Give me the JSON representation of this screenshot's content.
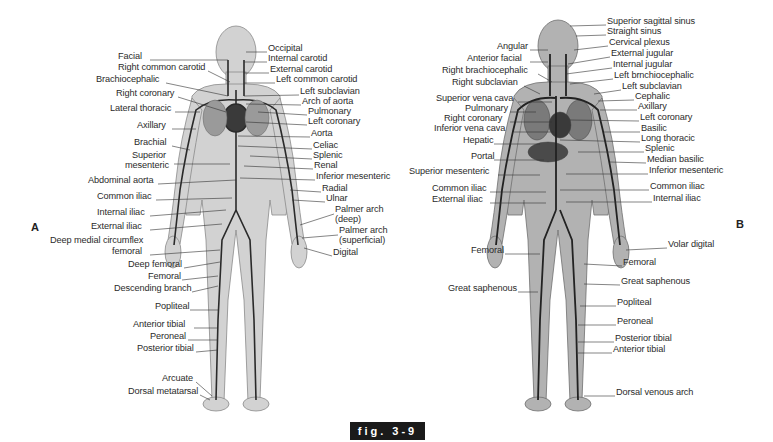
{
  "figure": {
    "caption": "fig. 3-9",
    "panel_a_letter": "A",
    "panel_b_letter": "B"
  },
  "panel_a": {
    "title": "Arterial system",
    "left_labels": [
      {
        "text": "Facial",
        "x": 118,
        "y": 56
      },
      {
        "text": "Right common carotid",
        "x": 118,
        "y": 67
      },
      {
        "text": "Brachiocephalic",
        "x": 96,
        "y": 79
      },
      {
        "text": "Right coronary",
        "x": 116,
        "y": 93
      },
      {
        "text": "Lateral thoracic",
        "x": 110,
        "y": 108
      },
      {
        "text": "Axillary",
        "x": 137,
        "y": 125
      },
      {
        "text": "Brachial",
        "x": 134,
        "y": 142
      },
      {
        "text": "Superior",
        "x": 132,
        "y": 155
      },
      {
        "text": "mesenteric",
        "x": 125,
        "y": 165
      },
      {
        "text": "Abdominal aorta",
        "x": 88,
        "y": 180
      },
      {
        "text": "Common iliac",
        "x": 97,
        "y": 196
      },
      {
        "text": "Internal iliac",
        "x": 97,
        "y": 212
      },
      {
        "text": "External iliac",
        "x": 91,
        "y": 226
      },
      {
        "text": "Deep medial circumflex",
        "x": 50,
        "y": 240
      },
      {
        "text": "femoral",
        "x": 112,
        "y": 251
      },
      {
        "text": "Deep femoral",
        "x": 128,
        "y": 264
      },
      {
        "text": "Femoral",
        "x": 148,
        "y": 276
      },
      {
        "text": "Descending branch",
        "x": 114,
        "y": 288
      },
      {
        "text": "Popliteal",
        "x": 155,
        "y": 306
      },
      {
        "text": "Anterior tibial",
        "x": 133,
        "y": 324
      },
      {
        "text": "Peroneal",
        "x": 150,
        "y": 336
      },
      {
        "text": "Posterior tibial",
        "x": 137,
        "y": 348
      },
      {
        "text": "Arcuate",
        "x": 162,
        "y": 378
      },
      {
        "text": "Dorsal metatarsal",
        "x": 128,
        "y": 391
      }
    ],
    "right_labels": [
      {
        "text": "Occipital",
        "x": 268,
        "y": 48
      },
      {
        "text": "Internal carotid",
        "x": 268,
        "y": 58
      },
      {
        "text": "External carotid",
        "x": 270,
        "y": 69
      },
      {
        "text": "Left common carotid",
        "x": 276,
        "y": 79
      },
      {
        "text": "Left subclavian",
        "x": 300,
        "y": 91
      },
      {
        "text": "Arch of aorta",
        "x": 302,
        "y": 101
      },
      {
        "text": "Pulmonary",
        "x": 308,
        "y": 111
      },
      {
        "text": "Left coronary",
        "x": 308,
        "y": 121
      },
      {
        "text": "Aorta",
        "x": 311,
        "y": 133
      },
      {
        "text": "Celiac",
        "x": 313,
        "y": 145
      },
      {
        "text": "Splenic",
        "x": 313,
        "y": 155
      },
      {
        "text": "Renal",
        "x": 314,
        "y": 165
      },
      {
        "text": "Inferior mesenteric",
        "x": 316,
        "y": 176
      },
      {
        "text": "Radial",
        "x": 322,
        "y": 188
      },
      {
        "text": "Ulnar",
        "x": 326,
        "y": 198
      },
      {
        "text": "Palmer arch",
        "x": 335,
        "y": 209
      },
      {
        "text": "(deep)",
        "x": 335,
        "y": 219
      },
      {
        "text": "Palmer arch",
        "x": 339,
        "y": 230
      },
      {
        "text": "(superficial)",
        "x": 339,
        "y": 240
      },
      {
        "text": "Digital",
        "x": 333,
        "y": 252
      }
    ]
  },
  "panel_b": {
    "title": "Venous system",
    "left_labels": [
      {
        "text": "Angular",
        "x": 497,
        "y": 46
      },
      {
        "text": "Anterior facial",
        "x": 467,
        "y": 58
      },
      {
        "text": "Right brachiocephalic",
        "x": 442,
        "y": 70
      },
      {
        "text": "Right subclavian",
        "x": 452,
        "y": 82
      },
      {
        "text": "Superior vena cava",
        "x": 436,
        "y": 98
      },
      {
        "text": "Pulmonary",
        "x": 465,
        "y": 108
      },
      {
        "text": "Right coronary",
        "x": 444,
        "y": 118
      },
      {
        "text": "Inferior vena cava",
        "x": 434,
        "y": 128
      },
      {
        "text": "Hepatic",
        "x": 463,
        "y": 140
      },
      {
        "text": "Portal",
        "x": 471,
        "y": 156
      },
      {
        "text": "Superior mesenteric",
        "x": 409,
        "y": 171
      },
      {
        "text": "Common iliac",
        "x": 432,
        "y": 188
      },
      {
        "text": "External iliac",
        "x": 432,
        "y": 199
      },
      {
        "text": "Femoral",
        "x": 471,
        "y": 250
      },
      {
        "text": "Great saphenous",
        "x": 448,
        "y": 288
      }
    ],
    "right_labels": [
      {
        "text": "Superior sagittal sinus",
        "x": 607,
        "y": 21
      },
      {
        "text": "Straight sinus",
        "x": 607,
        "y": 31
      },
      {
        "text": "Cervical plexus",
        "x": 609,
        "y": 42
      },
      {
        "text": "External jugular",
        "x": 611,
        "y": 53
      },
      {
        "text": "Internal jugular",
        "x": 613,
        "y": 64
      },
      {
        "text": "Left brnchiocephalic",
        "x": 614,
        "y": 75
      },
      {
        "text": "Left subclavian",
        "x": 622,
        "y": 86
      },
      {
        "text": "Cephalic",
        "x": 635,
        "y": 96
      },
      {
        "text": "Axillary",
        "x": 638,
        "y": 106
      },
      {
        "text": "Left coronary",
        "x": 640,
        "y": 117
      },
      {
        "text": "Basilic",
        "x": 641,
        "y": 128
      },
      {
        "text": "Long thoracic",
        "x": 641,
        "y": 138
      },
      {
        "text": "Splenic",
        "x": 645,
        "y": 148
      },
      {
        "text": "Median basilic",
        "x": 647,
        "y": 159
      },
      {
        "text": "Inferior mesenteric",
        "x": 649,
        "y": 170
      },
      {
        "text": "Common iliac",
        "x": 650,
        "y": 186
      },
      {
        "text": "Internal iliac",
        "x": 653,
        "y": 198
      },
      {
        "text": "Volar digital",
        "x": 668,
        "y": 244
      },
      {
        "text": "Femoral",
        "x": 623,
        "y": 262
      },
      {
        "text": "Great saphenous",
        "x": 621,
        "y": 281
      },
      {
        "text": "Popliteal",
        "x": 617,
        "y": 302
      },
      {
        "text": "Peroneal",
        "x": 617,
        "y": 321
      },
      {
        "text": "Posterior tibial",
        "x": 615,
        "y": 338
      },
      {
        "text": "Anterior tibial",
        "x": 613,
        "y": 349
      },
      {
        "text": "Dorsal venous arch",
        "x": 616,
        "y": 392
      }
    ]
  },
  "colors": {
    "body_fill_a": "#cfcfcf",
    "body_fill_b": "#a9a9a9",
    "vessel": "#2a2a2a",
    "leader_line": "#333333",
    "caption_bg": "#1a1a1a"
  }
}
